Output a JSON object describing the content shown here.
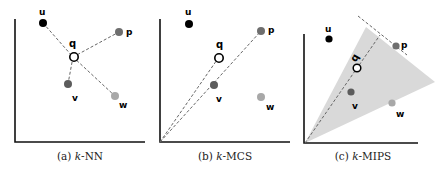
{
  "figure": {
    "panels": [
      {
        "id": "a",
        "caption_prefix": "(a) ",
        "caption_k": "k",
        "caption_rest": "-NN",
        "method": "k-NN"
      },
      {
        "id": "b",
        "caption_prefix": "(b) ",
        "caption_k": "k",
        "caption_rest": "-MCS",
        "method": "k-MCS"
      },
      {
        "id": "c",
        "caption_prefix": "(c) ",
        "caption_k": "k",
        "caption_rest": "-MIPS",
        "method": "k-MIPS"
      }
    ],
    "point_labels": {
      "u": "u",
      "q": "q",
      "p": "p",
      "v": "v",
      "w": "w"
    },
    "colors": {
      "u": "#000000",
      "p": "#6e6e6e",
      "v": "#5c5c5c",
      "w": "#a8a8a8",
      "q_stroke": "#000000",
      "dashed": "#666666",
      "cone_fill": "#d9d9d9",
      "axis": "#111111"
    }
  }
}
